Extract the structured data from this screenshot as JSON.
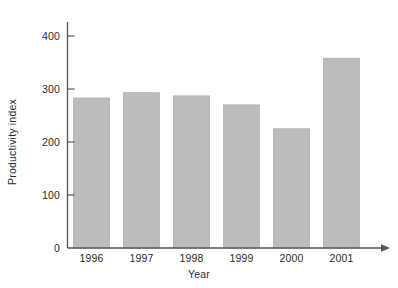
{
  "chart_data": {
    "type": "bar",
    "title": "",
    "subtitle": "",
    "xlabel": "Year",
    "ylabel": "Productivity index",
    "categories": [
      "1996",
      "1997",
      "1998",
      "1999",
      "2000",
      "2001"
    ],
    "values": [
      283,
      293,
      287,
      270,
      225,
      358
    ],
    "series": [
      {
        "name": "Productivity index",
        "values": [
          283,
          293,
          287,
          270,
          225,
          358
        ]
      }
    ],
    "ylim": [
      0,
      430
    ],
    "ytick_values": [
      0,
      100,
      200,
      300,
      400
    ],
    "ytick_labels": [
      "0",
      "100",
      "200",
      "300",
      "400"
    ],
    "xtick_labels": [
      "1996",
      "1997",
      "1998",
      "1999",
      "2000",
      "2001"
    ],
    "grid": false,
    "legend": false,
    "legend_position": "none",
    "annotations": [],
    "bar_color": "#bcbcbc",
    "bar_edge_color": "#b0b0b0",
    "axis_color": "#555555",
    "text_color": "#2b2b2b",
    "background_color": "#ffffff",
    "x_axis_arrow": true,
    "y_axis_arrow": false
  }
}
